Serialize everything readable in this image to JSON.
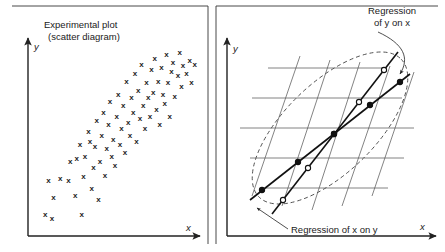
{
  "figure": {
    "width": 445,
    "height": 252,
    "background": "#ffffff",
    "ink_color": "#1a1a1a"
  },
  "left_panel": {
    "title_line1": "Experimental plot",
    "title_line2": "(scatter diagram)",
    "y_axis_label": "y",
    "x_axis_label": "x",
    "marker_glyph": "x",
    "marker_count": 74
  },
  "right_panel": {
    "y_axis_label": "y",
    "x_axis_label": "x",
    "label_y_on_x_line1": "Regression",
    "label_y_on_x_line2": "of y on x",
    "label_x_on_y": "Regression of x on y",
    "ellipse_style": "dashed",
    "grid_style": "sheared-lattice",
    "line_y_on_x_marker": "open-circle",
    "line_x_on_y_marker": "filled-circle"
  },
  "chart_data": {
    "type": "scatter",
    "title": "Experimental plot (scatter diagram)",
    "xlabel": "x",
    "ylabel": "y",
    "grid": false,
    "legend": "none",
    "xlim": [
      0,
      100
    ],
    "ylim": [
      0,
      100
    ],
    "points": [
      [
        8,
        8
      ],
      [
        12,
        6
      ],
      [
        13,
        17
      ],
      [
        10,
        26
      ],
      [
        17,
        27
      ],
      [
        22,
        26
      ],
      [
        23,
        36
      ],
      [
        26,
        18
      ],
      [
        27,
        38
      ],
      [
        29,
        45
      ],
      [
        30,
        8
      ],
      [
        31,
        28
      ],
      [
        32,
        39
      ],
      [
        34,
        52
      ],
      [
        35,
        47
      ],
      [
        36,
        22
      ],
      [
        37,
        33
      ],
      [
        38,
        44
      ],
      [
        39,
        58
      ],
      [
        40,
        16
      ],
      [
        41,
        36
      ],
      [
        42,
        50
      ],
      [
        43,
        62
      ],
      [
        44,
        29
      ],
      [
        45,
        43
      ],
      [
        46,
        56
      ],
      [
        47,
        68
      ],
      [
        48,
        39
      ],
      [
        49,
        48
      ],
      [
        50,
        34
      ],
      [
        51,
        60
      ],
      [
        52,
        72
      ],
      [
        53,
        45
      ],
      [
        54,
        54
      ],
      [
        55,
        66
      ],
      [
        56,
        41
      ],
      [
        57,
        79
      ],
      [
        58,
        57
      ],
      [
        59,
        50
      ],
      [
        60,
        70
      ],
      [
        61,
        62
      ],
      [
        62,
        83
      ],
      [
        63,
        47
      ],
      [
        64,
        74
      ],
      [
        65,
        59
      ],
      [
        66,
        88
      ],
      [
        67,
        66
      ],
      [
        68,
        54
      ],
      [
        69,
        78
      ],
      [
        70,
        70
      ],
      [
        71,
        60
      ],
      [
        72,
        85
      ],
      [
        73,
        73
      ],
      [
        74,
        91
      ],
      [
        75,
        64
      ],
      [
        76,
        79
      ],
      [
        77,
        56
      ],
      [
        78,
        86
      ],
      [
        79,
        72
      ],
      [
        80,
        67
      ],
      [
        81,
        93
      ],
      [
        82,
        78
      ],
      [
        83,
        60
      ],
      [
        84,
        84
      ],
      [
        85,
        89
      ],
      [
        86,
        71
      ],
      [
        88,
        82
      ],
      [
        89,
        94
      ],
      [
        90,
        76
      ],
      [
        91,
        87
      ],
      [
        93,
        83
      ],
      [
        95,
        90
      ],
      [
        96,
        78
      ],
      [
        98,
        88
      ]
    ]
  }
}
